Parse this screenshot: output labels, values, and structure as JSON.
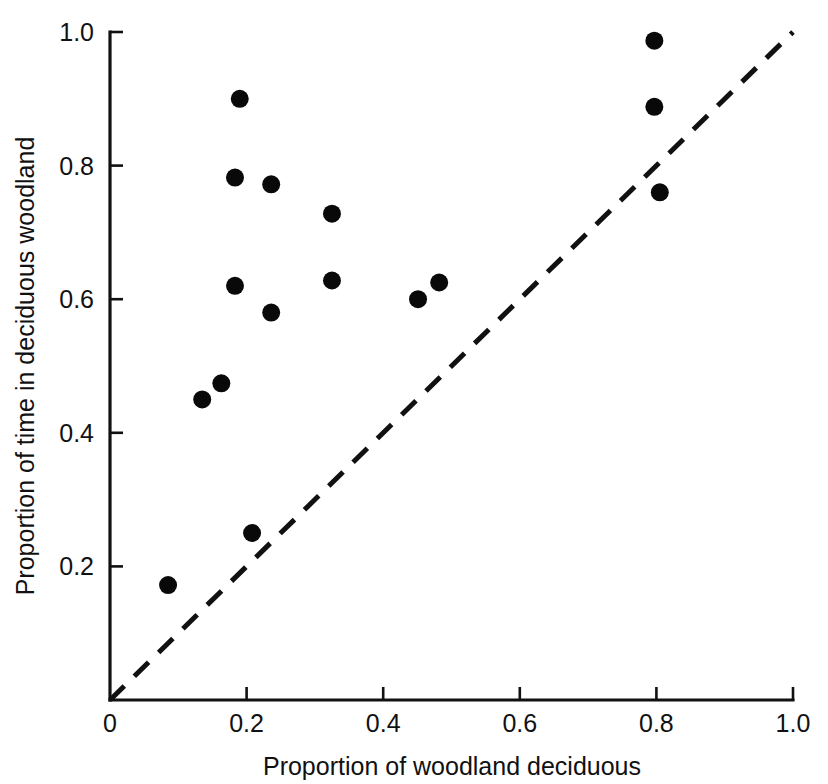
{
  "chart_data": {
    "type": "scatter",
    "title": "",
    "xlabel": "Proportion of woodland deciduous",
    "ylabel": "Proportion of time in deciduous woodland",
    "xlim": [
      0,
      1.0
    ],
    "ylim": [
      0,
      1.0
    ],
    "grid": false,
    "legend": "none",
    "x_ticks": [
      {
        "value": 0,
        "label": "0"
      },
      {
        "value": 0.2,
        "label": "0.2"
      },
      {
        "value": 0.4,
        "label": "0.4"
      },
      {
        "value": 0.6,
        "label": "0.6"
      },
      {
        "value": 0.8,
        "label": "0.8"
      },
      {
        "value": 1.0,
        "label": "1.0"
      }
    ],
    "y_ticks": [
      {
        "value": 0.2,
        "label": "0.2"
      },
      {
        "value": 0.4,
        "label": "0.4"
      },
      {
        "value": 0.6,
        "label": "0.6"
      },
      {
        "value": 0.8,
        "label": "0.8"
      },
      {
        "value": 1.0,
        "label": "1.0"
      }
    ],
    "series": [
      {
        "name": "sites",
        "marker": "filled-circle",
        "color": "#090909",
        "points": [
          {
            "x": 0.085,
            "y": 0.172
          },
          {
            "x": 0.135,
            "y": 0.45
          },
          {
            "x": 0.163,
            "y": 0.474
          },
          {
            "x": 0.183,
            "y": 0.62
          },
          {
            "x": 0.183,
            "y": 0.782
          },
          {
            "x": 0.19,
            "y": 0.9
          },
          {
            "x": 0.208,
            "y": 0.25
          },
          {
            "x": 0.236,
            "y": 0.58
          },
          {
            "x": 0.236,
            "y": 0.772
          },
          {
            "x": 0.325,
            "y": 0.628
          },
          {
            "x": 0.325,
            "y": 0.728
          },
          {
            "x": 0.451,
            "y": 0.6
          },
          {
            "x": 0.482,
            "y": 0.625
          },
          {
            "x": 0.797,
            "y": 0.987
          },
          {
            "x": 0.797,
            "y": 0.888
          },
          {
            "x": 0.805,
            "y": 0.76
          }
        ]
      }
    ],
    "reference_line": {
      "name": "one-to-one-line",
      "style": "dashed",
      "color": "#111111",
      "from": {
        "x": 0,
        "y": 0
      },
      "to": {
        "x": 1.0,
        "y": 1.0
      }
    }
  },
  "colors": {
    "background": "#ffffff",
    "axis": "#111111",
    "marker": "#090909"
  }
}
